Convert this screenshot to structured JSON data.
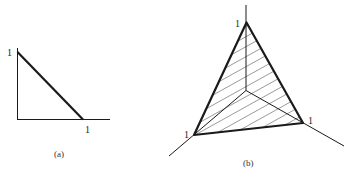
{
  "figure_a": {
    "caption": "(a)",
    "y_axis_label": "1",
    "x_axis_label": "1",
    "description": "2D simplex: line segment from (0,1) to (1,0)"
  },
  "figure_b": {
    "caption": "(b)",
    "top_vertex_label": "1",
    "left_vertex_label": "1",
    "right_vertex_label": "1",
    "description": "3D simplex: hatched triangle with vertices at unit points on three axes"
  },
  "colors": {
    "line": "#1a1a1a",
    "hatch": "#555555",
    "background": "#ffffff"
  }
}
